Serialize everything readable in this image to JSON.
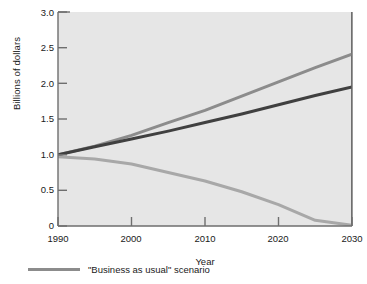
{
  "chart_data": {
    "type": "line",
    "title": "",
    "xlabel": "Year",
    "ylabel": "Billions of dollars",
    "xlim": [
      1990,
      2030
    ],
    "ylim": [
      0,
      3.0
    ],
    "grid": false,
    "legend_position": "below-axes",
    "xticks": [
      1990,
      2000,
      2010,
      2020,
      2030
    ],
    "xtick_labels": [
      "1990",
      "2000",
      "2010",
      "2020",
      "2030"
    ],
    "yticks": [
      0,
      0.5,
      1.0,
      1.5,
      2.0,
      2.5,
      3.0
    ],
    "ytick_labels": [
      "0",
      "0.5",
      "1.0",
      "1.5",
      "2.0",
      "2.5",
      "3.0"
    ],
    "x": [
      1990,
      1995,
      2000,
      2005,
      2010,
      2015,
      2020,
      2025,
      2030
    ],
    "series": [
      {
        "name": "\"Business as usual\" scenario",
        "color": "#8c8c8c",
        "values": [
          1.0,
          1.12,
          1.27,
          1.45,
          1.62,
          1.82,
          2.02,
          2.22,
          2.41
        ]
      },
      {
        "name": "",
        "color": "#404040",
        "values": [
          1.0,
          1.11,
          1.22,
          1.33,
          1.45,
          1.57,
          1.7,
          1.83,
          1.95
        ]
      },
      {
        "name": "",
        "color": "#a8a8a8",
        "values": [
          0.97,
          0.94,
          0.87,
          0.75,
          0.63,
          0.48,
          0.3,
          0.08,
          0.01
        ]
      }
    ],
    "legend": [
      {
        "label": "\"Business as usual\" scenario",
        "color": "#8c8c8c"
      }
    ]
  },
  "axis": {
    "y_title": "Billions of dollars",
    "x_title": "Year"
  }
}
